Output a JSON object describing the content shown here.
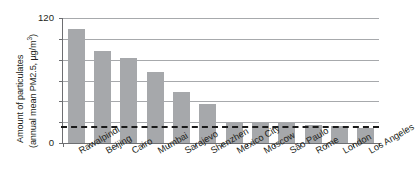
{
  "chart_data": {
    "type": "bar",
    "title": "",
    "subtitle": "",
    "xlabel": "",
    "ylabel_line1": "Amount of particulates",
    "ylabel_line2": "(annual mean PM2.5, µg/m",
    "ylabel_line2_sup": "3",
    "ylabel_line2_close": ")",
    "ylabel_full": "Amount of particulates (annual mean PM2.5, µg/m³)",
    "categories": [
      "Rawalpindi",
      "Beijing",
      "Cairo",
      "Mumbai",
      "Sarajevo",
      "Shenzhen",
      "Mexico City",
      "Moscow",
      "São Paulo",
      "Rome",
      "London",
      "Los Angeles"
    ],
    "values": [
      109,
      88,
      82,
      68,
      49,
      37,
      20,
      20,
      19,
      17,
      16,
      14
    ],
    "ylim": [
      0,
      120
    ],
    "ytick_values": [
      0,
      20,
      40,
      60,
      80,
      100,
      120
    ],
    "ytick_labels_shown": [
      "0",
      "120"
    ],
    "ytick_label_min": "0",
    "ytick_label_max": "120",
    "grid": true,
    "grid_orientation": "horizontal",
    "legend": "none",
    "bar_color": "#a6a8ab",
    "axis_color": "#6d6e71",
    "grid_color": "#a7a9ac",
    "threshold_line": {
      "value": 16,
      "style": "dashed",
      "color": "#1a1a1a"
    }
  }
}
